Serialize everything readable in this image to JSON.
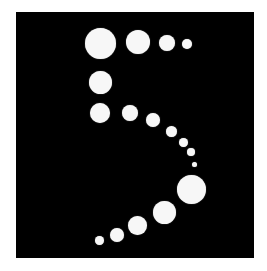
{
  "figure": {
    "numeral": "5",
    "background_color": "#ffffff",
    "canvas_color": "#000000",
    "dot_color": "#f7f7f7",
    "canvas": {
      "x": 16,
      "y": 12,
      "width": 238,
      "height": 246
    },
    "dots": [
      {
        "cx": 100,
        "cy": 43,
        "d": 31
      },
      {
        "cx": 138,
        "cy": 42,
        "d": 24
      },
      {
        "cx": 167,
        "cy": 43,
        "d": 16
      },
      {
        "cx": 187,
        "cy": 44,
        "d": 10
      },
      {
        "cx": 100,
        "cy": 82,
        "d": 23
      },
      {
        "cx": 100,
        "cy": 113,
        "d": 20
      },
      {
        "cx": 130,
        "cy": 113,
        "d": 16
      },
      {
        "cx": 153,
        "cy": 120,
        "d": 14
      },
      {
        "cx": 171,
        "cy": 131,
        "d": 11
      },
      {
        "cx": 183,
        "cy": 142,
        "d": 9
      },
      {
        "cx": 191,
        "cy": 152,
        "d": 8
      },
      {
        "cx": 194,
        "cy": 164,
        "d": 5
      },
      {
        "cx": 191,
        "cy": 189,
        "d": 29
      },
      {
        "cx": 164,
        "cy": 212,
        "d": 23
      },
      {
        "cx": 137,
        "cy": 225,
        "d": 19
      },
      {
        "cx": 117,
        "cy": 235,
        "d": 14
      },
      {
        "cx": 99,
        "cy": 240,
        "d": 9
      }
    ]
  }
}
